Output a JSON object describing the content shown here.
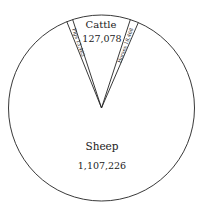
{
  "chart_data": {
    "type": "pie",
    "title": "",
    "categories": [
      "Sheep",
      "Cattle",
      "Pigs",
      "Horses"
    ],
    "values": [
      1107226,
      127078,
      13463,
      18468
    ],
    "value_labels": [
      "1,107,226",
      "127,078",
      "13,463",
      "18,468"
    ],
    "legend": "none (labels placed inside slices)",
    "grid": false,
    "colors": {
      "fill": "#ffffff",
      "stroke": "#222222"
    }
  },
  "labels": {
    "sheep_name": "Sheep",
    "sheep_value": "1,107,226",
    "cattle_name": "Cattle",
    "cattle_value": "127,078",
    "pigs": "Pigs 13,463",
    "horses": "Horses 18,468"
  }
}
